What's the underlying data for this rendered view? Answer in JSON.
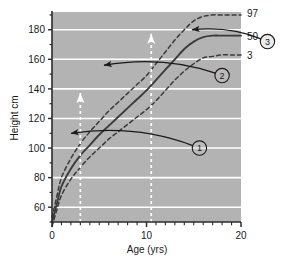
{
  "figure": {
    "background_color": "#ffffff",
    "plot_background_color": "#b3b3b3",
    "gridline_color": "#ffffff",
    "axis_color": "#2b2b2b",
    "curve_color": "#3b3b3b",
    "annotation_color": "#1a1a1a",
    "marker_color": "#ffffff"
  },
  "chart_data": {
    "type": "line",
    "title": "",
    "subtitle": "",
    "xlabel": "Age (yrs)",
    "ylabel": "Height cm",
    "xlim": [
      0,
      20
    ],
    "ylim": [
      50,
      192
    ],
    "grid": true,
    "legend_position": "right-of-curve-ends",
    "x_ticks_major": [
      0,
      10,
      20
    ],
    "x_tick_labels": [
      "0",
      "10",
      "20"
    ],
    "x_minor_tick_interval": 1,
    "y_ticks_major": [
      60,
      80,
      100,
      120,
      140,
      160,
      180
    ],
    "y_tick_labels": [
      "60",
      "80",
      "100",
      "120",
      "140",
      "160",
      "180"
    ],
    "y_minor_tick_interval": 10,
    "series": [
      {
        "name": "97",
        "label": "97",
        "style": "dashed",
        "x": [
          0,
          0.5,
          1,
          2,
          3,
          4,
          5,
          6,
          7,
          8,
          9,
          10,
          11,
          12,
          13,
          14,
          15,
          16,
          17,
          18,
          19,
          20
        ],
        "values": [
          53,
          67,
          80,
          93,
          103,
          111,
          118,
          125,
          131,
          137,
          143,
          149,
          157,
          165,
          173,
          180,
          186,
          189,
          190,
          190,
          190,
          190
        ]
      },
      {
        "name": "50",
        "label": "50",
        "style": "solid",
        "x": [
          0,
          0.5,
          1,
          2,
          3,
          4,
          5,
          6,
          7,
          8,
          9,
          10,
          11,
          12,
          13,
          14,
          15,
          16,
          17,
          18,
          19,
          20
        ],
        "values": [
          50,
          62,
          74,
          86,
          95,
          102,
          109,
          115,
          121,
          127,
          133,
          139,
          146,
          153,
          160,
          167,
          172,
          175,
          176,
          176,
          176,
          176
        ]
      },
      {
        "name": "3",
        "label": "3",
        "style": "dashed",
        "x": [
          0,
          0.5,
          1,
          2,
          3,
          4,
          5,
          6,
          7,
          8,
          9,
          10,
          11,
          12,
          13,
          14,
          15,
          16,
          17,
          18,
          19,
          20
        ],
        "values": [
          47,
          58,
          68,
          79,
          87,
          94,
          100,
          106,
          111,
          116,
          121,
          126,
          132,
          139,
          146,
          152,
          157,
          161,
          162,
          163,
          163,
          163
        ]
      }
    ],
    "annotations": [
      {
        "id": "marker-1",
        "type": "vertical-dashed-arrow",
        "x": 3,
        "y_from": 50,
        "y_to": 140,
        "color": "#ffffff",
        "description": "white dashed vertical arrow at age 3 up to 140 cm"
      },
      {
        "id": "marker-2",
        "type": "vertical-dashed-arrow",
        "x": 10.5,
        "y_from": 50,
        "y_to": 180,
        "color": "#ffffff",
        "description": "white dashed vertical arrow at age 10.5 up to 180 cm"
      },
      {
        "id": "callout-1",
        "type": "curved-arrow-with-circled-number",
        "label": "1",
        "circle_x": 15.6,
        "circle_y": 100,
        "arrow_tip_x": 2.0,
        "arrow_tip_y": 110,
        "description": "circled 1 with curved arrow pointing left at ~110 cm"
      },
      {
        "id": "callout-2",
        "type": "curved-arrow-with-circled-number",
        "label": "2",
        "circle_x": 18.0,
        "circle_y": 149,
        "arrow_tip_x": 5.5,
        "arrow_tip_y": 156,
        "description": "circled 2 with curved arrow pointing left at ~156 cm"
      },
      {
        "id": "callout-3",
        "type": "curved-arrow-with-circled-number",
        "label": "3",
        "circle_x": 22.8,
        "circle_y": 172,
        "arrow_tip_x": 14.8,
        "arrow_tip_y": 180,
        "description": "circled 3 with curved arrow pointing left at ~180 cm"
      }
    ]
  }
}
